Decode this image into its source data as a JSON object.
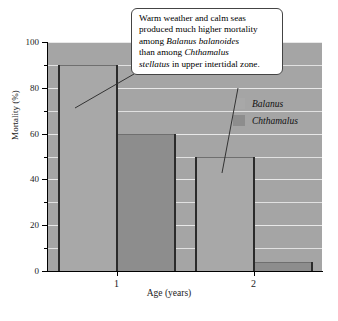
{
  "chart_data": {
    "type": "bar",
    "title": "",
    "xlabel": "Age (years)",
    "ylabel": "Mortality (%)",
    "categories": [
      "1",
      "2"
    ],
    "series": [
      {
        "name": "Balanus",
        "values": [
          90,
          50
        ],
        "color": "#a8a8a8"
      },
      {
        "name": "Chthamalus",
        "values": [
          60,
          4
        ],
        "color": "#8d8d8d"
      }
    ],
    "ylim": [
      0,
      100
    ],
    "ytick_labels": [
      "0",
      "20",
      "40",
      "60",
      "80",
      "100"
    ],
    "ytick_values": [
      0,
      20,
      40,
      60,
      80,
      100
    ],
    "yminor_values": [
      10,
      30,
      50,
      70,
      90
    ],
    "grid": true,
    "legend_position": "upper-right",
    "plot_background": "#a5a5a5",
    "annotation": "Warm weather and calm seas produced much higher mortality among Balanus balanoides than among Chthamalus stellatus in upper intertidal zone."
  },
  "legend": {
    "items": [
      {
        "label": "Balanus",
        "swatch": "light"
      },
      {
        "label": "Chthamalus",
        "swatch": "dark"
      }
    ]
  },
  "callout": {
    "line1": "Warm weather and calm seas",
    "line2": "produced much higher mortality",
    "line3_prefix": "among ",
    "line3_italic": "Balanus balanoides",
    "line4_prefix": "than among ",
    "line4_italic": "Chthamalus",
    "line5_italic": "stellatus",
    "line5_suffix": " in upper intertidal zone."
  },
  "axes": {
    "y_title": "Mortality (%)",
    "x_title": "Age (years)"
  },
  "caption": {
    "text": ""
  }
}
